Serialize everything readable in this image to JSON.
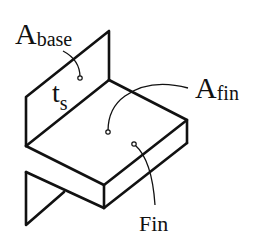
{
  "diagram": {
    "labels": {
      "a_base_main": "A",
      "a_base_sub": "base",
      "ts_main": "t",
      "ts_sub": "s",
      "a_fin_main": "A",
      "a_fin_sub": "fin",
      "fin": "Fin"
    },
    "colors": {
      "stroke": "#111111",
      "background": "#ffffff"
    }
  }
}
